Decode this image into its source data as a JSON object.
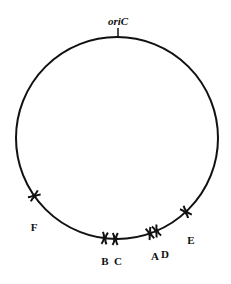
{
  "diagram": {
    "type": "circular chromosome map",
    "origin_label": "oriC",
    "sites": [
      {
        "label": "F",
        "angle_deg": 235
      },
      {
        "label": "B",
        "angle_deg": 186
      },
      {
        "label": "C",
        "angle_deg": 181
      },
      {
        "label": "A",
        "angle_deg": 162
      },
      {
        "label": "D",
        "angle_deg": 158
      },
      {
        "label": "E",
        "angle_deg": 136
      }
    ],
    "colors": {
      "line": "#111111",
      "background": "#ffffff"
    }
  }
}
